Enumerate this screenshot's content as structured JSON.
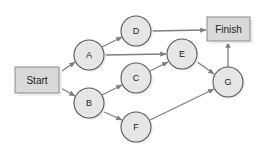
{
  "diagram": {
    "type": "network-diagram",
    "colors": {
      "background": "#ffffff",
      "node_fill": "#e6e6e6",
      "node_stroke": "#555555",
      "box_fill": "#d9d9d9",
      "box_stroke": "#8c8c8c",
      "edge": "#7f7f7f",
      "shadow": "#efefef",
      "text": "#222222"
    },
    "boxes": [
      {
        "id": "start",
        "label": "Start",
        "x": 15,
        "y": 67,
        "w": 44,
        "h": 26
      },
      {
        "id": "finish",
        "label": "Finish",
        "x": 207,
        "y": 17,
        "w": 43,
        "h": 24
      }
    ],
    "nodes": [
      {
        "id": "A",
        "label": "A",
        "cx": 89,
        "cy": 55,
        "r": 15
      },
      {
        "id": "B",
        "label": "B",
        "cx": 89,
        "cy": 103,
        "r": 15
      },
      {
        "id": "C",
        "label": "C",
        "cx": 136,
        "cy": 78,
        "r": 15
      },
      {
        "id": "D",
        "label": "D",
        "cx": 136,
        "cy": 31,
        "r": 15
      },
      {
        "id": "E",
        "label": "E",
        "cx": 182,
        "cy": 54,
        "r": 15
      },
      {
        "id": "F",
        "label": "F",
        "cx": 136,
        "cy": 127,
        "r": 15
      },
      {
        "id": "G",
        "label": "G",
        "cx": 228,
        "cy": 82,
        "r": 15
      }
    ],
    "edges": [
      {
        "from": "Start",
        "to": "A"
      },
      {
        "from": "Start",
        "to": "B"
      },
      {
        "from": "A",
        "to": "D"
      },
      {
        "from": "A",
        "to": "E"
      },
      {
        "from": "B",
        "to": "C"
      },
      {
        "from": "B",
        "to": "F"
      },
      {
        "from": "C",
        "to": "E"
      },
      {
        "from": "D",
        "to": "Finish"
      },
      {
        "from": "E",
        "to": "G"
      },
      {
        "from": "F",
        "to": "G"
      },
      {
        "from": "G",
        "to": "Finish"
      }
    ]
  }
}
